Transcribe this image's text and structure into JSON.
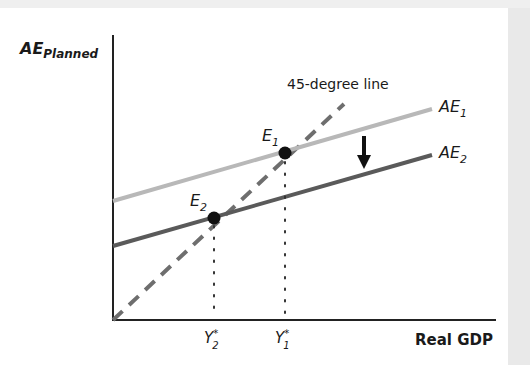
{
  "diagram": {
    "y_axis_label": {
      "main": "AE",
      "sub": "Planned"
    },
    "x_axis_label": "Real GDP",
    "dashed_line_label": "45-degree line",
    "curves": [
      {
        "id": "AE1",
        "main": "AE",
        "sub": "1",
        "color": "#b8b8b8"
      },
      {
        "id": "AE2",
        "main": "AE",
        "sub": "2",
        "color": "#5a5a5a"
      }
    ],
    "equilibria": [
      {
        "id": "E1",
        "main": "E",
        "sub": "1"
      },
      {
        "id": "E2",
        "main": "E",
        "sub": "2"
      }
    ],
    "x_ticks": [
      {
        "id": "Y2",
        "main": "Y",
        "sup": "*",
        "sub": "2"
      },
      {
        "id": "Y1",
        "main": "Y",
        "sup": "*",
        "sub": "1"
      }
    ],
    "shift_arrow": "down",
    "colors": {
      "axis": "#222222",
      "dashed": "#6e6e6e",
      "point": "#111111",
      "background": "#ffffff"
    }
  }
}
